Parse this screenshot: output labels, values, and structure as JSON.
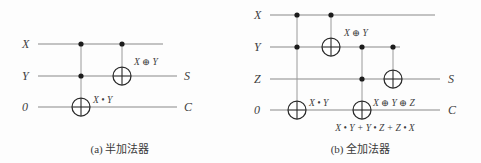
{
  "figures": [
    {
      "id": "half-adder",
      "caption": "(a) 半加法器",
      "inputs": [
        {
          "label": "X",
          "y": 44
        },
        {
          "label": "Y",
          "y": 76
        },
        {
          "label": "0",
          "y": 107
        }
      ],
      "outputs": [
        {
          "label": "S",
          "y": 76
        },
        {
          "label": "C",
          "y": 107
        }
      ],
      "annotations": [
        {
          "text": "X ⊕ Y",
          "x": 130,
          "y": 62
        },
        {
          "text": "X • Y",
          "x": 90,
          "y": 100
        }
      ]
    },
    {
      "id": "full-adder",
      "caption": "(b) 全加法器",
      "inputs": [
        {
          "label": "X",
          "y": 15
        },
        {
          "label": "Y",
          "y": 47
        },
        {
          "label": "Z",
          "y": 79
        },
        {
          "label": "0",
          "y": 110
        }
      ],
      "outputs": [
        {
          "label": "S",
          "y": 79
        },
        {
          "label": "C",
          "y": 110
        }
      ],
      "annotations": [
        {
          "text": "X ⊕ Y",
          "x": 107,
          "y": 33
        },
        {
          "text": "X • Y",
          "x": 64,
          "y": 103
        },
        {
          "text": "X ⊕ Y ⊕ Z",
          "x": 129,
          "y": 103
        }
      ],
      "carry_expression": "X • Y + Y • Z + Z • X"
    }
  ],
  "colors": {
    "wire": "#8a8a8a",
    "gate_stroke": "#2a2a2a",
    "dot": "#1c1c1c",
    "text": "#3d3d3d",
    "background": "#fdfdfd"
  }
}
